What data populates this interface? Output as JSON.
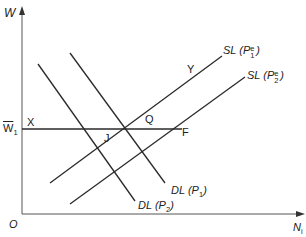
{
  "axes": {
    "y_label": "W",
    "x_label": "N",
    "x_label_sub": "i",
    "origin_label": "O"
  },
  "wage_level": {
    "label": "W",
    "label_sub": "1",
    "bar": true
  },
  "points": {
    "X": "X",
    "J": "J",
    "Q": "Q",
    "F": "F",
    "Y": "Y"
  },
  "curves": {
    "sl1": {
      "name": "SL",
      "price": "P",
      "sub": "1",
      "sup": "e"
    },
    "sl2": {
      "name": "SL",
      "price": "P",
      "sub": "2",
      "sup": "e"
    },
    "dl1": {
      "name": "DL",
      "price": "P",
      "sub": "1"
    },
    "dl2": {
      "name": "DL",
      "price": "P",
      "sub": "2"
    }
  },
  "colors": {
    "line": "#2a2a2a",
    "axis": "#555555",
    "background": "#ffffff"
  }
}
